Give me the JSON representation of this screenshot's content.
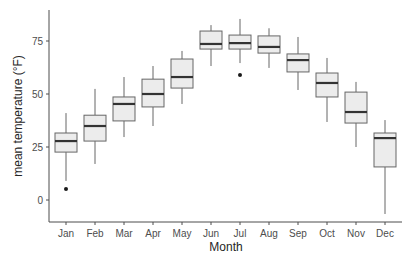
{
  "chart_data": {
    "type": "boxplot",
    "title": "",
    "xlabel": "Month",
    "ylabel": "mean temperature (°F)",
    "ylim": [
      -11,
      89
    ],
    "yticks": [
      0,
      25,
      50,
      75
    ],
    "grid": false,
    "legend": null,
    "categories": [
      "Jan",
      "Feb",
      "Mar",
      "Apr",
      "May",
      "Jun",
      "Jul",
      "Aug",
      "Sep",
      "Oct",
      "Nov",
      "Dec"
    ],
    "boxes": [
      {
        "month": "Jan",
        "whisker_low": 9.0,
        "q1": 22.6,
        "median": 27.8,
        "q3": 31.6,
        "whisker_high": 41.0,
        "outliers": [
          5.2
        ]
      },
      {
        "month": "Feb",
        "whisker_low": 17.0,
        "q1": 27.8,
        "median": 34.9,
        "q3": 40.0,
        "whisker_high": 52.4,
        "outliers": []
      },
      {
        "month": "Mar",
        "whisker_low": 29.7,
        "q1": 37.3,
        "median": 45.3,
        "q3": 48.6,
        "whisker_high": 58.0,
        "outliers": []
      },
      {
        "month": "Apr",
        "whisker_low": 34.9,
        "q1": 43.9,
        "median": 50.0,
        "q3": 57.0,
        "whisker_high": 63.2,
        "outliers": []
      },
      {
        "month": "May",
        "whisker_low": 45.3,
        "q1": 52.8,
        "median": 58.0,
        "q3": 66.5,
        "whisker_high": 70.3,
        "outliers": []
      },
      {
        "month": "Jun",
        "whisker_low": 63.2,
        "q1": 71.2,
        "median": 73.6,
        "q3": 79.7,
        "whisker_high": 82.5,
        "outliers": []
      },
      {
        "month": "Jul",
        "whisker_low": 64.6,
        "q1": 71.2,
        "median": 74.0,
        "q3": 77.8,
        "whisker_high": 85.4,
        "outliers": [
          59.0
        ]
      },
      {
        "month": "Aug",
        "whisker_low": 62.3,
        "q1": 69.3,
        "median": 72.2,
        "q3": 77.4,
        "whisker_high": 81.0,
        "outliers": []
      },
      {
        "month": "Sep",
        "whisker_low": 51.9,
        "q1": 60.4,
        "median": 66.0,
        "q3": 68.9,
        "whisker_high": 76.9,
        "outliers": []
      },
      {
        "month": "Oct",
        "whisker_low": 36.8,
        "q1": 48.6,
        "median": 55.2,
        "q3": 59.9,
        "whisker_high": 67.0,
        "outliers": []
      },
      {
        "month": "Nov",
        "whisker_low": 25.0,
        "q1": 36.3,
        "median": 41.5,
        "q3": 50.9,
        "whisker_high": 55.7,
        "outliers": []
      },
      {
        "month": "Dec",
        "whisker_low": -6.6,
        "q1": 15.6,
        "median": 29.2,
        "q3": 31.6,
        "whisker_high": 37.7,
        "outliers": []
      }
    ],
    "colors": {
      "box_fill": "#ececec",
      "box_stroke": "#666666",
      "median": "#333333",
      "whisker": "#666666",
      "outlier": "#1a1a1a",
      "axis": "#4d4d4d"
    }
  }
}
